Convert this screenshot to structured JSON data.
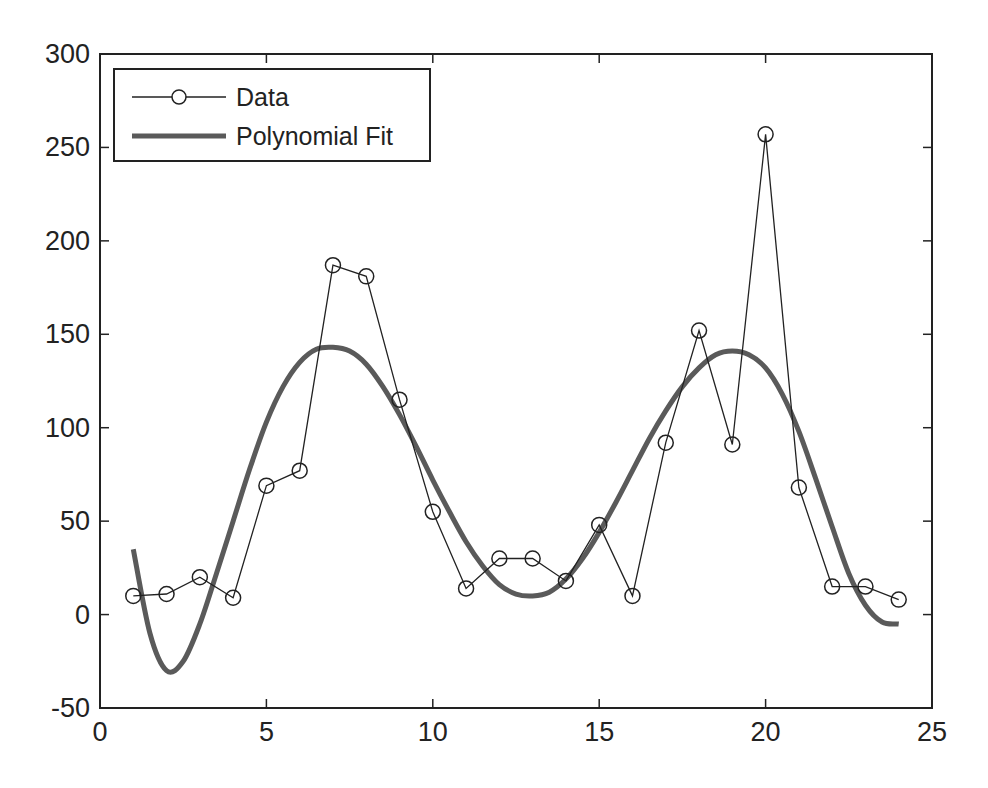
{
  "chart_data": {
    "type": "line",
    "title": "",
    "xlabel": "",
    "ylabel": "",
    "xlim": [
      0,
      25
    ],
    "ylim": [
      -50,
      300
    ],
    "xticks": [
      0,
      5,
      10,
      15,
      20,
      25
    ],
    "yticks": [
      -50,
      0,
      50,
      100,
      150,
      200,
      250,
      300
    ],
    "grid": false,
    "legend_position": "upper left",
    "series": [
      {
        "name": "Data",
        "style": "thin black line with open circle markers",
        "color": "#222222",
        "x": [
          1,
          2,
          3,
          4,
          5,
          6,
          7,
          8,
          9,
          10,
          11,
          12,
          13,
          14,
          15,
          16,
          17,
          18,
          19,
          20,
          21,
          22,
          23,
          24
        ],
        "values": [
          10,
          11,
          20,
          9,
          69,
          77,
          187,
          181,
          115,
          55,
          14,
          30,
          30,
          18,
          48,
          10,
          92,
          152,
          91,
          257,
          68,
          15,
          15,
          8
        ]
      },
      {
        "name": "Polynomial Fit",
        "style": "thick gray line",
        "color": "#5a5a5a",
        "x": [
          1,
          1.5,
          2,
          2.5,
          3,
          3.5,
          4,
          4.5,
          5,
          5.5,
          6,
          6.5,
          7,
          7.5,
          8,
          8.5,
          9,
          9.5,
          10,
          10.5,
          11,
          11.5,
          12,
          12.5,
          13,
          13.5,
          14,
          14.5,
          15,
          15.5,
          16,
          16.5,
          17,
          17.5,
          18,
          18.5,
          19,
          19.5,
          20,
          20.5,
          21,
          21.5,
          22,
          22.5,
          23,
          23.5,
          24
        ],
        "values": [
          35,
          -10,
          -30,
          -25,
          -5,
          22,
          50,
          78,
          103,
          122,
          135,
          142,
          143,
          141,
          134,
          122,
          107,
          90,
          72,
          55,
          39,
          26,
          16,
          11,
          10,
          12,
          19,
          30,
          44,
          60,
          77,
          94,
          109,
          122,
          132,
          139,
          141,
          139,
          132,
          118,
          98,
          73,
          47,
          22,
          5,
          -4,
          -5
        ]
      }
    ]
  },
  "legend": {
    "items": [
      {
        "label": "Data"
      },
      {
        "label": "Polynomial Fit"
      }
    ]
  },
  "axes": {
    "x_tick_labels": [
      "0",
      "5",
      "10",
      "15",
      "20",
      "25"
    ],
    "y_tick_labels": [
      "-50",
      "0",
      "50",
      "100",
      "150",
      "200",
      "250",
      "300"
    ]
  }
}
